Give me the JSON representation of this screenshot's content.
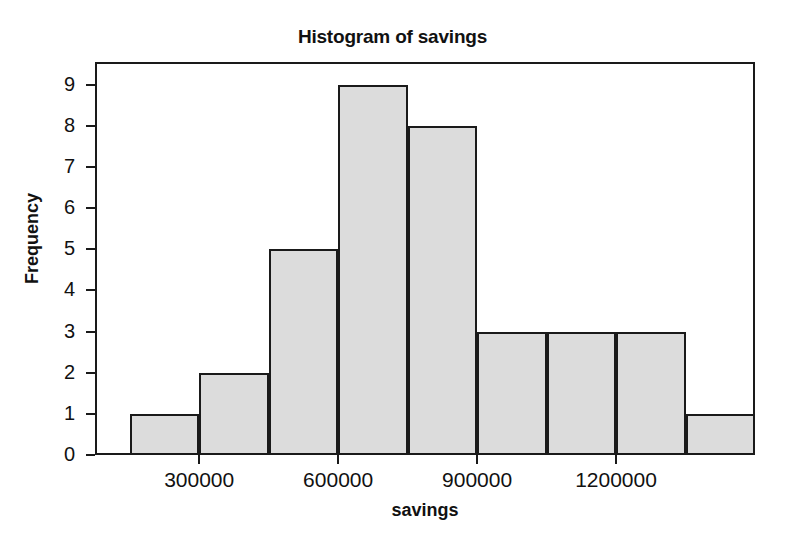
{
  "chart_data": {
    "type": "bar",
    "title": "Histogram of savings",
    "xlabel": "savings",
    "ylabel": "Frequency",
    "xlim": [
      75000,
      1500000
    ],
    "ylim": [
      0,
      9.55
    ],
    "grid": false,
    "legend": "none",
    "bin_width": 150000,
    "bin_edges": [
      150000,
      300000,
      450000,
      600000,
      750000,
      900000,
      1050000,
      1200000,
      1350000,
      1500000
    ],
    "categories": [
      "150000-300000",
      "300000-450000",
      "450000-600000",
      "600000-750000",
      "750000-900000",
      "900000-1050000",
      "1050000-1200000",
      "1200000-1350000",
      "1350000-1500000"
    ],
    "values": [
      1,
      2,
      5,
      9,
      8,
      3,
      3,
      3,
      1
    ],
    "xticks": [
      300000,
      600000,
      900000,
      1200000
    ],
    "xtick_labels": [
      "300000",
      "600000",
      "900000",
      "1200000"
    ],
    "yticks": [
      0,
      1,
      2,
      3,
      4,
      5,
      6,
      7,
      8,
      9
    ],
    "ytick_labels": [
      "0",
      "1",
      "2",
      "3",
      "4",
      "5",
      "6",
      "7",
      "8",
      "9"
    ],
    "bar_fill_color": "#dcdcdc",
    "bar_edge_color": "#1a1a1a",
    "background_color": "#ffffff"
  }
}
